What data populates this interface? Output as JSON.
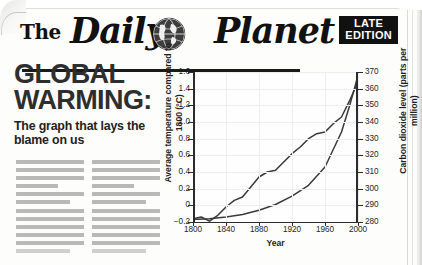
{
  "masthead": {
    "the": "The",
    "daily": "Daily",
    "planet": "Planet",
    "globe_icon": "globe-icon",
    "edition_line1": "LATE",
    "edition_line2": "EDITION"
  },
  "article": {
    "headline_line1": "GLOBAL",
    "headline_line2": "WARMING:",
    "subhead": "The graph that lays the blame on us",
    "body_placeholder_columns": 2,
    "body_placeholder_lines_per_column": 12
  },
  "colors": {
    "ink": "#1a1a1a",
    "headline": "#2e2e2e",
    "paper": "#fdfdfb",
    "badge_bg": "#111111",
    "badge_text": "#ffffff",
    "grid": "#eeeeee",
    "line": "#3a3a3a"
  },
  "chart_data": {
    "type": "line",
    "title": "",
    "xlabel": "Year",
    "ylabel": "Average temperature compared to 1800 (°C)",
    "y2label": "Carbon dioxide level (parts per million)",
    "xlim": [
      1800,
      2000
    ],
    "ylim": [
      -0.2,
      1.6
    ],
    "y2lim": [
      280,
      370
    ],
    "xticks": [
      1800,
      1840,
      1880,
      1920,
      1960,
      2000
    ],
    "yticks": [
      -0.2,
      0,
      0.2,
      0.4,
      0.6,
      0.8,
      1.0,
      1.2,
      1.4,
      1.6
    ],
    "yticklabels": [
      "−0.2",
      "0",
      "0.2",
      "0.4",
      "0.6",
      "0.8",
      "1.0",
      "1.2",
      "1.4",
      "1.6"
    ],
    "y2ticks": [
      280,
      290,
      300,
      310,
      320,
      330,
      340,
      350,
      360,
      370
    ],
    "grid": true,
    "legend": "none",
    "series": [
      {
        "name": "Average temperature compared to 1800 (°C)",
        "axis": "left",
        "x": [
          1800,
          1810,
          1820,
          1830,
          1840,
          1850,
          1860,
          1870,
          1880,
          1890,
          1900,
          1910,
          1920,
          1930,
          1940,
          1950,
          1960,
          1970,
          1980,
          1990,
          2000
        ],
        "y": [
          -0.16,
          -0.14,
          -0.19,
          -0.12,
          -0.02,
          0.06,
          0.1,
          0.22,
          0.34,
          0.4,
          0.42,
          0.52,
          0.62,
          0.7,
          0.8,
          0.86,
          0.88,
          0.98,
          1.06,
          1.26,
          1.48
        ]
      },
      {
        "name": "Carbon dioxide level (parts per million)",
        "axis": "right",
        "x": [
          1800,
          1820,
          1840,
          1860,
          1880,
          1900,
          1920,
          1940,
          1960,
          1980,
          1990,
          2000
        ],
        "y": [
          281.5,
          282.0,
          283.0,
          284.5,
          287.0,
          290.5,
          295.5,
          302.0,
          313.0,
          334.0,
          350.0,
          368.0
        ]
      }
    ]
  }
}
